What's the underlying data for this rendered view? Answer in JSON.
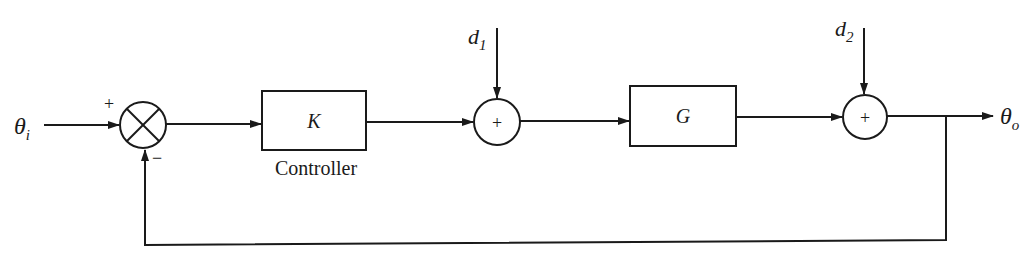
{
  "diagram": {
    "type": "feedback-control-block-diagram",
    "input": {
      "symbol": "θ",
      "subscript": "i"
    },
    "output": {
      "symbol": "θ",
      "subscript": "o"
    },
    "summing_junction_1": {
      "style": "cross",
      "plus_sign": "+",
      "minus_sign": "−"
    },
    "controller_block": {
      "label": "K",
      "caption": "Controller"
    },
    "summing_junction_2": {
      "sign": "+"
    },
    "plant_block": {
      "label": "G"
    },
    "summing_junction_3": {
      "sign": "+"
    },
    "disturbance_1": {
      "symbol": "d",
      "subscript": "1"
    },
    "disturbance_2": {
      "symbol": "d",
      "subscript": "2"
    },
    "feedback": "unity negative feedback from output to summing junction 1"
  },
  "colors": {
    "ink": "#1a1a1a",
    "background": "#ffffff"
  }
}
